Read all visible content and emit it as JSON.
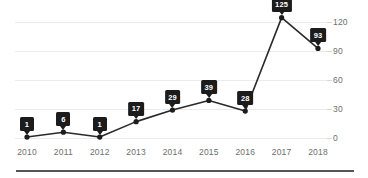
{
  "chart_data": {
    "type": "line",
    "title": "",
    "subtitle": "",
    "xlabel": "",
    "ylabel": "",
    "categories": [
      "2010",
      "2011",
      "2012",
      "2013",
      "2014",
      "2015",
      "2016",
      "2017",
      "2018"
    ],
    "values": [
      1,
      6,
      1,
      17,
      29,
      39,
      28,
      125,
      93
    ],
    "point_labels": [
      "1",
      "6",
      "1",
      "17",
      "29",
      "39",
      "28",
      "125",
      "93"
    ],
    "series": [
      {
        "name": "",
        "values": [
          1,
          6,
          1,
          17,
          29,
          39,
          28,
          125,
          93
        ]
      }
    ],
    "ylim": [
      0,
      135
    ],
    "xlim_index": [
      0,
      8
    ],
    "y_ticks": [
      0,
      30,
      60,
      90,
      120
    ],
    "y_tick_labels": [
      "0",
      "30",
      "60",
      "90",
      "120"
    ],
    "x_tick_labels": [
      "2010",
      "2011",
      "2012",
      "2013",
      "2014",
      "2015",
      "2016",
      "2017",
      "2018"
    ],
    "grid": true,
    "grid_axis": "y",
    "legend": false,
    "legend_position": "none",
    "markers": true,
    "data_labels_visible": true,
    "y_axis_position": "right",
    "annotations": [],
    "colors": {
      "line": "#2a2a2a",
      "marker": "#1c1c1c",
      "label_background": "#1c1c1c",
      "label_text": "#ffffff",
      "gridline": "#ebebeb",
      "tick_text": "#6e6e6e",
      "background": "#ffffff",
      "bottom_rule": "#555555"
    }
  }
}
